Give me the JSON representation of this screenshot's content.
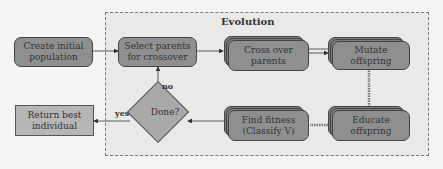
{
  "diagram": {
    "group": {
      "title": "Evolution"
    },
    "nodes": {
      "create": "Create initial population",
      "select": "Select parents for crossover",
      "crossover": "Cross over parents",
      "mutate": "Mutate offspring",
      "educate": "Educate offspring",
      "fitness_line1": "Find fitness",
      "fitness_line2": "(Classify V)",
      "done": "Done?",
      "return": "Return best individual"
    },
    "edge_labels": {
      "yes": "yes",
      "no": "no"
    },
    "colors": {
      "process_fill": "#8f8f8f",
      "decision_fill": "#a9a9a9",
      "terminal_fill": "#b6b6b6",
      "group_fill": "#e9e9e7"
    }
  }
}
